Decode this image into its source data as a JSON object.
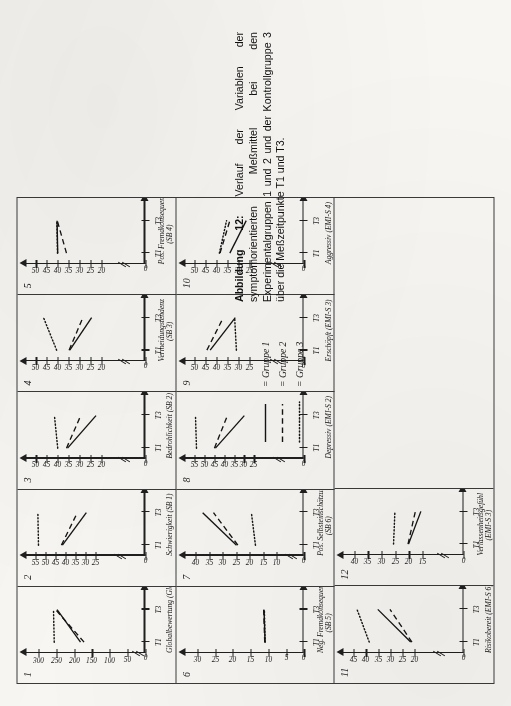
{
  "figure": {
    "caption_label": "Abbildung 12:",
    "caption_text": "Verlauf der Variablen der symptomorientierten Meßmittel bei den Experimentalgruppen 1 und 2 und der Kontrollgruppe 3 über die Meßzeitpunkte T1 und T3."
  },
  "legend": {
    "entries": [
      {
        "style": "solid",
        "eq": "=",
        "label": "Gruppe 1"
      },
      {
        "style": "dashed",
        "eq": "=",
        "label": "Gruppe 2"
      },
      {
        "style": "dotted",
        "eq": "=",
        "label": "Gruppe 3"
      }
    ]
  },
  "axis_labels": {
    "t1": "T1",
    "t3": "T3",
    "zero": "0"
  },
  "chart_data": [
    {
      "id": "1",
      "type": "line",
      "title": "Globalbewertung (Glob)",
      "subtitle": "",
      "x": [
        "T1",
        "T3"
      ],
      "xlabel": "",
      "ylabel": "",
      "yticks": [
        0,
        50,
        100,
        150,
        200,
        250,
        300
      ],
      "ylim": [
        0,
        320
      ],
      "axis_break": true,
      "series": [
        {
          "name": "Gruppe 1",
          "style": "solid",
          "values": [
            182,
            248
          ]
        },
        {
          "name": "Gruppe 2",
          "style": "dashed",
          "values": [
            172,
            252
          ]
        },
        {
          "name": "Gruppe 3",
          "style": "dotted",
          "values": [
            256,
            258
          ]
        }
      ]
    },
    {
      "id": "2",
      "type": "line",
      "title": "Schwierigkeit (SB 1)",
      "subtitle": "",
      "x": [
        "T1",
        "T3"
      ],
      "xlabel": "",
      "ylabel": "",
      "yticks": [
        0,
        25,
        30,
        35,
        40,
        45,
        50,
        55
      ],
      "ylim": [
        0,
        57
      ],
      "axis_break": true,
      "series": [
        {
          "name": "Gruppe 1",
          "style": "solid",
          "values": [
            41.5,
            29.5
          ]
        },
        {
          "name": "Gruppe 2",
          "style": "dashed",
          "values": [
            42.0,
            34.0
          ]
        },
        {
          "name": "Gruppe 3",
          "style": "dotted",
          "values": [
            53.5,
            53.8
          ]
        }
      ]
    },
    {
      "id": "3",
      "type": "line",
      "title": "Bedrohlichkeit (SB 2)",
      "subtitle": "",
      "x": [
        "T1",
        "T3"
      ],
      "xlabel": "",
      "ylabel": "",
      "yticks": [
        0,
        20,
        25,
        30,
        35,
        40,
        45,
        50
      ],
      "ylim": [
        0,
        52
      ],
      "axis_break": true,
      "series": [
        {
          "name": "Gruppe 1",
          "style": "solid",
          "values": [
            35.5,
            22.5
          ]
        },
        {
          "name": "Gruppe 2",
          "style": "dashed",
          "values": [
            36.0,
            29.5
          ]
        },
        {
          "name": "Gruppe 3",
          "style": "dotted",
          "values": [
            40.0,
            41.5
          ]
        }
      ]
    },
    {
      "id": "4",
      "type": "line",
      "title": "Vermeidungstendenz",
      "subtitle": "(SB 3)",
      "x": [
        "T1",
        "T3"
      ],
      "xlabel": "",
      "ylabel": "",
      "yticks": [
        0,
        20,
        25,
        30,
        35,
        40,
        45,
        50
      ],
      "ylim": [
        0,
        52
      ],
      "axis_break": true,
      "series": [
        {
          "name": "Gruppe 1",
          "style": "solid",
          "values": [
            34.5,
            24.5
          ]
        },
        {
          "name": "Gruppe 2",
          "style": "dashed",
          "values": [
            34.8,
            28.5
          ]
        },
        {
          "name": "Gruppe 3",
          "style": "dotted",
          "values": [
            40.5,
            46.5
          ]
        }
      ]
    },
    {
      "id": "5",
      "type": "line",
      "title": "Pos. Fremdkonsequenz",
      "subtitle": "(SB 4)",
      "x": [
        "T1",
        "T3"
      ],
      "xlabel": "",
      "ylabel": "",
      "yticks": [
        0,
        20,
        25,
        30,
        35,
        40,
        45,
        50
      ],
      "ylim": [
        0,
        52
      ],
      "axis_break": true,
      "series": [
        {
          "name": "Gruppe 1",
          "style": "solid",
          "values": [
            40.0,
            40.3
          ]
        },
        {
          "name": "Gruppe 2",
          "style": "dashed",
          "values": [
            36.0,
            40.2
          ]
        },
        {
          "name": "Gruppe 3",
          "style": "dotted",
          "values": [
            40.1,
            40.4
          ]
        }
      ]
    },
    {
      "id": "6",
      "type": "line",
      "title": "Neg. Fremdkonsequenz",
      "subtitle": "(SB 5)",
      "x": [
        "T1",
        "T3"
      ],
      "xlabel": "",
      "ylabel": "",
      "yticks": [
        0,
        5,
        10,
        15,
        20,
        25,
        30
      ],
      "ylim": [
        0,
        32
      ],
      "axis_break": false,
      "series": [
        {
          "name": "Gruppe 1",
          "style": "solid",
          "values": [
            11.0,
            11.3
          ]
        },
        {
          "name": "Gruppe 2",
          "style": "dashed",
          "values": [
            11.1,
            11.4
          ]
        },
        {
          "name": "Gruppe 3",
          "style": "dotted",
          "values": [
            11.0,
            11.2
          ]
        }
      ]
    },
    {
      "id": "7",
      "type": "line",
      "title": "Pos. Selbsteinschätzung",
      "subtitle": "(SB 6)",
      "x": [
        "T1",
        "T3"
      ],
      "xlabel": "",
      "ylabel": "",
      "yticks": [
        0,
        10,
        15,
        20,
        25,
        30,
        35,
        40
      ],
      "ylim": [
        0,
        42
      ],
      "axis_break": true,
      "series": [
        {
          "name": "Gruppe 1",
          "style": "solid",
          "values": [
            25.0,
            37.5
          ]
        },
        {
          "name": "Gruppe 2",
          "style": "dashed",
          "values": [
            24.5,
            33.5
          ]
        },
        {
          "name": "Gruppe 3",
          "style": "dotted",
          "values": [
            18.0,
            19.5
          ]
        }
      ]
    },
    {
      "id": "8",
      "type": "line",
      "title": "Depressiv (EMI-S 2)",
      "subtitle": "",
      "x": [
        "T1",
        "T3"
      ],
      "xlabel": "",
      "ylabel": "",
      "yticks": [
        0,
        25,
        30,
        35,
        40,
        45,
        50,
        55
      ],
      "ylim": [
        0,
        57
      ],
      "axis_break": true,
      "series": [
        {
          "name": "Gruppe 1",
          "style": "solid",
          "values": [
            44.5,
            30.0
          ]
        },
        {
          "name": "Gruppe 2",
          "style": "dashed",
          "values": [
            45.0,
            38.5
          ]
        },
        {
          "name": "Gruppe 3",
          "style": "dotted",
          "values": [
            54.0,
            54.5
          ]
        }
      ]
    },
    {
      "id": "9",
      "type": "line",
      "title": "Erschöpft (EMI-S 3)",
      "subtitle": "",
      "x": [
        "T1",
        "T3"
      ],
      "xlabel": "",
      "ylabel": "",
      "yticks": [
        0,
        25,
        30,
        35,
        40,
        45,
        50
      ],
      "ylim": [
        0,
        52
      ],
      "axis_break": true,
      "series": [
        {
          "name": "Gruppe 1",
          "style": "solid",
          "values": [
            43.0,
            31.5
          ]
        },
        {
          "name": "Gruppe 2",
          "style": "dashed",
          "values": [
            44.5,
            37.0
          ]
        },
        {
          "name": "Gruppe 3",
          "style": "dotted",
          "values": [
            31.0,
            31.8
          ]
        }
      ]
    },
    {
      "id": "10",
      "type": "line",
      "title": "Aggressiv (EMI-S 4)",
      "subtitle": "",
      "x": [
        "T1",
        "T3"
      ],
      "xlabel": "",
      "ylabel": "",
      "yticks": [
        0,
        25,
        30,
        35,
        40,
        45,
        50
      ],
      "ylim": [
        0,
        52
      ],
      "axis_break": true,
      "series": [
        {
          "name": "Gruppe 1",
          "style": "solid",
          "values": [
            34.0,
            26.5
          ]
        },
        {
          "name": "Gruppe 2",
          "style": "dashed",
          "values": [
            38.5,
            34.0
          ]
        },
        {
          "name": "Gruppe 3",
          "style": "dotted",
          "values": [
            38.8,
            35.5
          ]
        }
      ]
    },
    {
      "id": "11",
      "type": "line",
      "title": "Risikobereit (EMI-S 6)",
      "subtitle": "",
      "x": [
        "T1",
        "T3"
      ],
      "xlabel": "",
      "ylabel": "",
      "yticks": [
        0,
        20,
        25,
        30,
        35,
        40,
        45
      ],
      "ylim": [
        0,
        47
      ],
      "axis_break": true,
      "series": [
        {
          "name": "Gruppe 1",
          "style": "solid",
          "values": [
            21.5,
            35.0
          ]
        },
        {
          "name": "Gruppe 2",
          "style": "dashed",
          "values": [
            21.0,
            30.0
          ]
        },
        {
          "name": "Gruppe 3",
          "style": "dotted",
          "values": [
            38.5,
            43.5
          ]
        }
      ]
    },
    {
      "id": "12",
      "type": "line",
      "title": "Verlassenheitsgefühl",
      "subtitle": "(EMI-S 3)",
      "x": [
        "T1",
        "T3"
      ],
      "xlabel": "",
      "ylabel": "",
      "yticks": [
        0,
        15,
        20,
        25,
        30,
        35,
        40
      ],
      "ylim": [
        0,
        42
      ],
      "axis_break": true,
      "series": [
        {
          "name": "Gruppe 1",
          "style": "solid",
          "values": [
            20.0,
            15.5
          ]
        },
        {
          "name": "Gruppe 2",
          "style": "dashed",
          "values": [
            20.2,
            17.5
          ]
        },
        {
          "name": "Gruppe 3",
          "style": "dotted",
          "values": [
            25.5,
            25.0
          ]
        }
      ]
    }
  ]
}
